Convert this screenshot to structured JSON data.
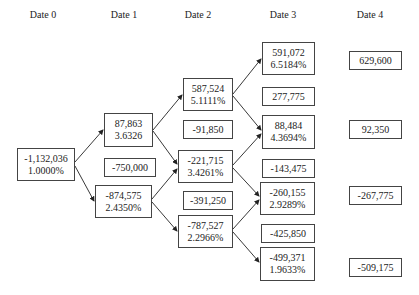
{
  "headers": [
    "Date 0",
    "Date 1",
    "Date 2",
    "Date 3",
    "Date 4"
  ],
  "date0": {
    "root": {
      "value": "-1,132,036",
      "rate": "1.0000%"
    }
  },
  "date1": {
    "up": {
      "value": "87,863",
      "rate": "3.6326"
    },
    "mid": {
      "value": "-750,000"
    },
    "down": {
      "value": "-874,575",
      "rate": "2.4350%"
    }
  },
  "date2": {
    "uu": {
      "value": "587,524",
      "rate": "5.1111%"
    },
    "mid1": {
      "value": "-91,850"
    },
    "ud": {
      "value": "-221,715",
      "rate": "3.4261%"
    },
    "mid2": {
      "value": "-391,250"
    },
    "dd": {
      "value": "-787,527",
      "rate": "2.2966%"
    }
  },
  "date3": {
    "uuu": {
      "value": "591,072",
      "rate": "6.5184%"
    },
    "mid1": {
      "value": "277,775"
    },
    "uud": {
      "value": "88,484",
      "rate": "4.3694%"
    },
    "mid2": {
      "value": "-143,475"
    },
    "udd": {
      "value": "-260,155",
      "rate": "2.9289%"
    },
    "mid3": {
      "value": "-425,850"
    },
    "ddd": {
      "value": "-499,371",
      "rate": "1.9633%"
    }
  },
  "date4": {
    "n1": {
      "value": "629,600"
    },
    "n2": {
      "value": "92,350"
    },
    "n3": {
      "value": "-267,775"
    },
    "n4": {
      "value": "-509,175"
    }
  }
}
